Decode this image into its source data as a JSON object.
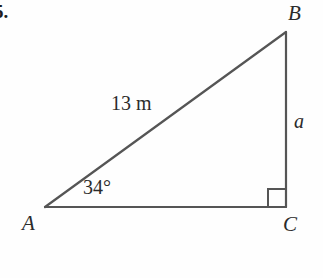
{
  "figure": {
    "type": "right-triangle-diagram",
    "item_number": "5.",
    "background_color": "#fefefe",
    "stroke_color": "#555555",
    "text_color": "#2b2b2b",
    "stroke_width": 2,
    "vertices": {
      "A": {
        "label": "A",
        "x": 45,
        "y": 207
      },
      "B": {
        "label": "B",
        "x": 286,
        "y": 32
      },
      "C": {
        "label": "C",
        "x": 286,
        "y": 207
      }
    },
    "labels": {
      "hypotenuse": "13 m",
      "opposite_side": "a",
      "angle_at_a": "34°",
      "vertex_a": "A",
      "vertex_b": "B",
      "vertex_c": "C"
    },
    "right_angle": {
      "at_vertex": "C",
      "marker_size": 18,
      "marker_name": "right-angle-marker"
    }
  }
}
